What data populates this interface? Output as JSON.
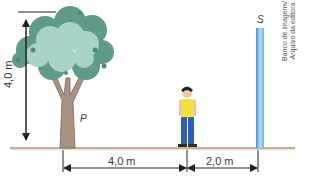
{
  "figure": {
    "top_cut_text": "",
    "labels": {
      "tree_height": "4,0 m",
      "tree": "P",
      "mirror": "S",
      "distance_tree_person": "4,0 m",
      "distance_person_mirror": "2,0 m"
    },
    "credit": {
      "line1": "Banco de imagens/",
      "line2": "Arquivo da editora"
    },
    "colors": {
      "ground": "#c9b99a",
      "canopy_light": "#a9d3c8",
      "canopy_dark": "#5f9a8a",
      "trunk": "#a89282",
      "mirror": "#6fb3ea",
      "shirt": "#f2e23a",
      "pants": "#2c5fb8",
      "line": "#222222"
    }
  }
}
